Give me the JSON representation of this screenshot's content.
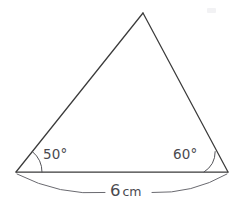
{
  "figure": {
    "kind": "triangle-diagram",
    "background_color": "#ffffff",
    "stroke_color": "#3b3b3b",
    "label_color": "#4a4a4f",
    "triangle": {
      "vertices": {
        "left": {
          "x": 16,
          "y": 172
        },
        "right": {
          "x": 228,
          "y": 172
        },
        "apex": {
          "x": 143,
          "y": 13
        }
      },
      "sides": {
        "base_label": "6 cm",
        "base_value": 6,
        "base_unit": "cm"
      }
    },
    "angles": [
      {
        "name": "left-base-angle",
        "label": "50°",
        "value": 50,
        "unit": "degrees",
        "at_vertex": "left",
        "arc_radius": 26
      },
      {
        "name": "right-base-angle",
        "label": "60°",
        "value": 60,
        "unit": "degrees",
        "at_vertex": "right",
        "arc_radius": 24
      }
    ],
    "dimension": {
      "name": "base-dimension",
      "label_number": "6",
      "label_unit": "cm",
      "full_label": "6 cm",
      "position": "below-base"
    }
  }
}
